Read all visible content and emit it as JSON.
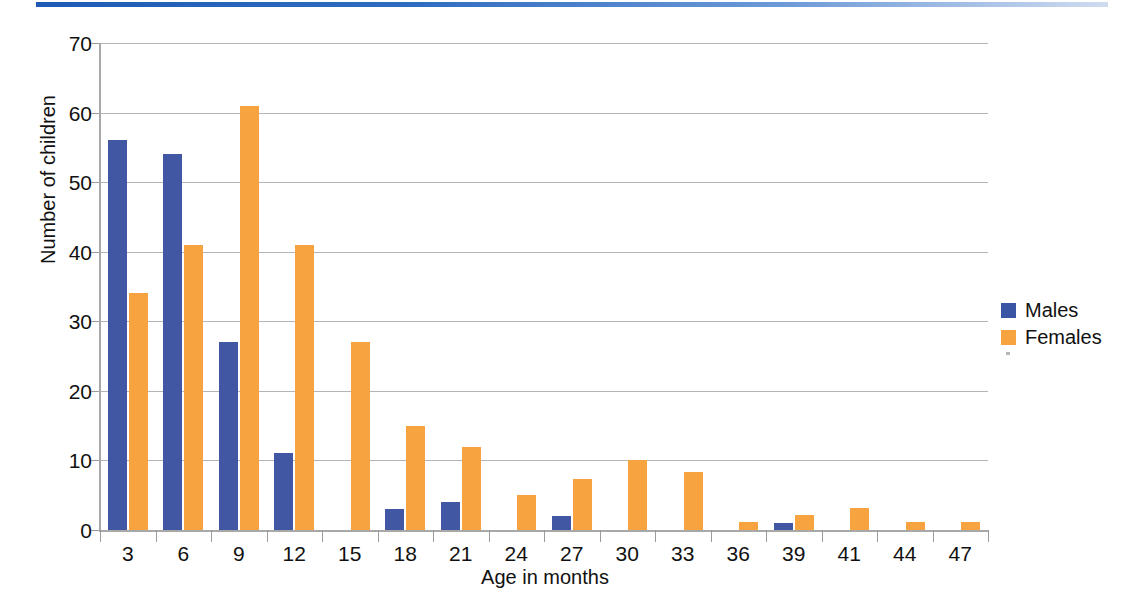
{
  "chart_data": {
    "type": "bar",
    "title": "",
    "xlabel": "Age in months",
    "ylabel": "Number of children",
    "categories": [
      "3",
      "6",
      "9",
      "12",
      "15",
      "18",
      "21",
      "24",
      "27",
      "30",
      "33",
      "36",
      "39",
      "41",
      "44",
      "47"
    ],
    "series": [
      {
        "name": "Males",
        "color": "#4257a4",
        "values": [
          56,
          54,
          27,
          11,
          0,
          3,
          4,
          0,
          2,
          0,
          0,
          0,
          1,
          0,
          0,
          0
        ]
      },
      {
        "name": "Females",
        "color": "#f7a440",
        "values": [
          34,
          41,
          61,
          41,
          27,
          15,
          12,
          5,
          7.3,
          10,
          8.3,
          1.2,
          2.2,
          3.2,
          1.2,
          1.2
        ]
      }
    ],
    "ylim": [
      0,
      70
    ],
    "yticks": [
      0,
      10,
      20,
      30,
      40,
      50,
      60,
      70
    ],
    "grid": "horizontal",
    "legend_position": "right"
  },
  "legend": {
    "items": [
      {
        "label": "Males"
      },
      {
        "label": "Females"
      }
    ]
  },
  "colors": {
    "males": "#4257a4",
    "females": "#f7a440",
    "gridline": "#b4b4b4",
    "axis": "#a8a8a8",
    "top_rule": "#1f5bb5"
  }
}
